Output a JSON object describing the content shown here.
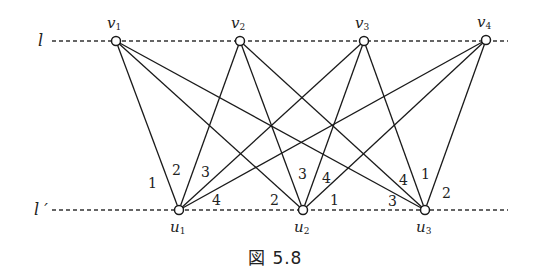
{
  "figure": {
    "caption": "図 5.8",
    "lines": {
      "top": {
        "label": "l",
        "y": 41,
        "x1": 52,
        "x2": 508
      },
      "bottom": {
        "label": "l ′",
        "y": 210,
        "x1": 52,
        "x2": 508
      }
    },
    "top_nodes": [
      {
        "id": "v1",
        "name": "v",
        "sub": "1",
        "x": 116,
        "y": 41
      },
      {
        "id": "v2",
        "name": "v",
        "sub": "2",
        "x": 240,
        "y": 41
      },
      {
        "id": "v3",
        "name": "v",
        "sub": "3",
        "x": 364,
        "y": 41
      },
      {
        "id": "v4",
        "name": "v",
        "sub": "4",
        "x": 486,
        "y": 40
      }
    ],
    "bottom_nodes": [
      {
        "id": "u1",
        "name": "u",
        "sub": "1",
        "x": 179,
        "y": 210
      },
      {
        "id": "u2",
        "name": "u",
        "sub": "2",
        "x": 303,
        "y": 210
      },
      {
        "id": "u3",
        "name": "u",
        "sub": "3",
        "x": 425,
        "y": 210
      }
    ],
    "edges": [
      {
        "from": "v1",
        "to": "u1",
        "label": "1",
        "lx": 152,
        "ly": 188
      },
      {
        "from": "v2",
        "to": "u1",
        "label": "2",
        "lx": 176,
        "ly": 175
      },
      {
        "from": "v3",
        "to": "u1",
        "label": "3",
        "lx": 205,
        "ly": 177
      },
      {
        "from": "v4",
        "to": "u1",
        "label": "4",
        "lx": 216,
        "ly": 205
      },
      {
        "from": "v1",
        "to": "u2",
        "label": "2",
        "lx": 274,
        "ly": 205
      },
      {
        "from": "v2",
        "to": "u2",
        "label": "3",
        "lx": 302,
        "ly": 179
      },
      {
        "from": "v3",
        "to": "u2",
        "label": "4",
        "lx": 326,
        "ly": 183
      },
      {
        "from": "v4",
        "to": "u2",
        "label": "1",
        "lx": 334,
        "ly": 205
      },
      {
        "from": "v1",
        "to": "u3",
        "label": "3",
        "lx": 392,
        "ly": 206
      },
      {
        "from": "v2",
        "to": "u3",
        "label": "4",
        "lx": 403,
        "ly": 185
      },
      {
        "from": "v3",
        "to": "u3",
        "label": "1",
        "lx": 425,
        "ly": 179
      },
      {
        "from": "v4",
        "to": "u3",
        "label": "2",
        "lx": 446,
        "ly": 198
      }
    ]
  }
}
